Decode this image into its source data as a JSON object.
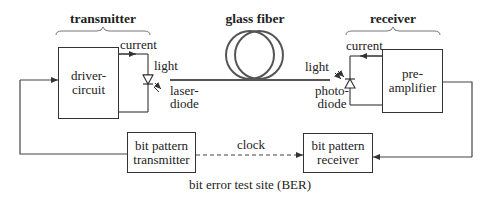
{
  "sections": {
    "transmitter": "transmitter",
    "glass_fiber": "glass fiber",
    "receiver": "receiver"
  },
  "blocks": {
    "driver_circuit": [
      "driver-",
      "circuit"
    ],
    "pre_amplifier": [
      "pre-",
      "amplifier"
    ],
    "bit_pattern_transmitter": [
      "bit pattern",
      "transmitter"
    ],
    "bit_pattern_receiver": [
      "bit pattern",
      "receiver"
    ]
  },
  "labels": {
    "tx_current": "current",
    "tx_light": "light",
    "laser_diode": [
      "laser-",
      "diode"
    ],
    "rx_current": "current",
    "rx_light": "light",
    "photo_diode": [
      "photo-",
      "diode"
    ],
    "clock": "clock",
    "ber_site": "bit error test site  (BER)"
  },
  "colors": {
    "line": "#444444",
    "fiber": "#555555",
    "text": "#222222"
  }
}
